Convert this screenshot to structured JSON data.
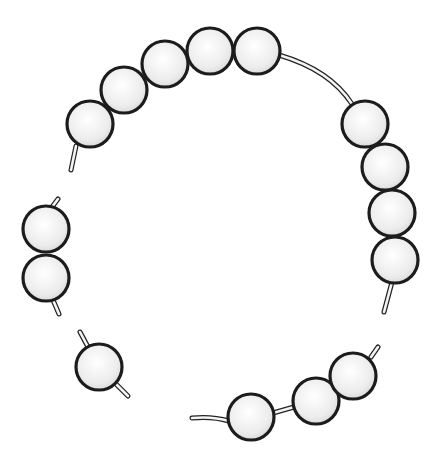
{
  "figure": {
    "bead_radius": 23,
    "colors": {
      "outline": "#1c1c1c",
      "bead_light": "#ffffff",
      "bead_shade": "#dcdcdc",
      "string_fill": "#f4f4f4",
      "background": "#ffffff"
    }
  },
  "segments": [
    {
      "name": "main-arc",
      "beads": [
        {
          "cx": 90,
          "cy": 124
        },
        {
          "cx": 124,
          "cy": 90
        },
        {
          "cx": 165,
          "cy": 64
        },
        {
          "cx": 210,
          "cy": 51
        },
        {
          "cx": 257,
          "cy": 51
        },
        {
          "cx": 365,
          "cy": 124
        },
        {
          "cx": 385,
          "cy": 167
        },
        {
          "cx": 392,
          "cy": 213
        },
        {
          "cx": 395,
          "cy": 260
        }
      ],
      "strings": [
        "M 76 146 L 71 170",
        "M 279 55 Q 330 70 352 104",
        "M 392 282 L 384 312"
      ]
    },
    {
      "name": "left-pair",
      "beads": [
        {
          "cx": 46,
          "cy": 229
        },
        {
          "cx": 46,
          "cy": 278
        }
      ],
      "strings": [
        "M 52 207 L 58 199",
        "M 53 300 L 59 314"
      ]
    },
    {
      "name": "single-bead",
      "beads": [
        {
          "cx": 99,
          "cy": 367
        }
      ],
      "strings": [
        "M 80 332 L 88 347",
        "M 116 384 L 128 396"
      ]
    },
    {
      "name": "bottom-arc",
      "beads": [
        {
          "cx": 251,
          "cy": 417
        },
        {
          "cx": 316,
          "cy": 401
        },
        {
          "cx": 353,
          "cy": 376
        }
      ],
      "strings": [
        "M 192 418 Q 212 416 229 421",
        "M 273 413 L 294 407",
        "M 371 357 L 378 347"
      ]
    }
  ]
}
